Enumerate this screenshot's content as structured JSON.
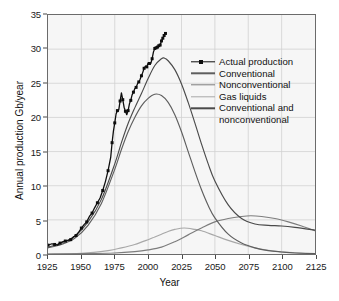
{
  "chart_data": {
    "type": "line",
    "title": "",
    "xlabel": "Year",
    "ylabel": "Annual production Gb/year",
    "xlim": [
      1925,
      2125
    ],
    "ylim": [
      0,
      35
    ],
    "xticks": [
      1925,
      1950,
      1975,
      2000,
      2025,
      2050,
      2075,
      2100,
      2125
    ],
    "yticks": [
      0,
      5,
      10,
      15,
      20,
      25,
      30,
      35
    ],
    "grid": true,
    "legend_position": "upper right",
    "series": [
      {
        "name": "Actual production",
        "color": "#0d0d0d",
        "style": "line-markers",
        "x": [
          1925,
          1928,
          1930,
          1932,
          1934,
          1936,
          1938,
          1940,
          1942,
          1944,
          1946,
          1948,
          1950,
          1952,
          1954,
          1956,
          1958,
          1960,
          1962,
          1964,
          1966,
          1968,
          1970,
          1972,
          1973,
          1974,
          1975,
          1976,
          1977,
          1978,
          1979,
          1980,
          1981,
          1982,
          1983,
          1984,
          1985,
          1986,
          1987,
          1988,
          1989,
          1990,
          1991,
          1992,
          1993,
          1994,
          1995,
          1996,
          1997,
          1998,
          1999,
          2000,
          2001,
          2002,
          2003,
          2004,
          2005,
          2006,
          2007,
          2008,
          2009,
          2010,
          2011,
          2012,
          2013
        ],
        "values": [
          1.3,
          1.5,
          1.4,
          1.3,
          1.6,
          1.8,
          1.9,
          2.0,
          2.1,
          2.5,
          2.7,
          3.2,
          3.8,
          4.3,
          4.7,
          5.5,
          6.0,
          6.8,
          7.5,
          8.2,
          9.3,
          10.6,
          12.2,
          14.2,
          16.3,
          18.0,
          19.2,
          20.5,
          21.0,
          21.1,
          22.4,
          23.6,
          22.6,
          21.5,
          20.9,
          20.4,
          21.0,
          22.0,
          22.5,
          23.3,
          23.7,
          24.2,
          24.4,
          24.9,
          25.2,
          25.6,
          26.1,
          26.6,
          27.2,
          27.5,
          27.4,
          28.0,
          27.9,
          27.9,
          28.6,
          29.6,
          30.1,
          30.2,
          30.3,
          30.5,
          30.6,
          31.2,
          31.6,
          32.0,
          32.3
        ]
      },
      {
        "name": "Conventional",
        "color": "#5e5e5e",
        "style": "line",
        "peak_year": 2005,
        "peak_value": 23.4,
        "x": [
          1925,
          1935,
          1945,
          1955,
          1965,
          1975,
          1980,
          1985,
          1990,
          1995,
          2000,
          2005,
          2010,
          2015,
          2020,
          2025,
          2030,
          2035,
          2040,
          2045,
          2050,
          2060,
          2070,
          2080,
          2090,
          2100,
          2110,
          2125
        ],
        "values": [
          0.9,
          1.4,
          2.3,
          4.2,
          7.4,
          12.4,
          15.3,
          17.9,
          20.0,
          21.7,
          22.8,
          23.4,
          23.2,
          22.2,
          20.4,
          17.9,
          15.0,
          12.1,
          9.4,
          7.1,
          5.3,
          2.9,
          1.6,
          0.9,
          0.5,
          0.3,
          0.15,
          0.05
        ]
      },
      {
        "name": "Nonconventional",
        "color": "#7d7d7d",
        "style": "line",
        "peak_year": 2077,
        "peak_value": 5.6,
        "x": [
          1925,
          1950,
          1975,
          1990,
          2000,
          2010,
          2020,
          2030,
          2040,
          2050,
          2060,
          2070,
          2077,
          2085,
          2095,
          2105,
          2115,
          2125
        ],
        "values": [
          0.0,
          0.05,
          0.15,
          0.35,
          0.6,
          1.0,
          1.8,
          2.8,
          3.8,
          4.7,
          5.2,
          5.5,
          5.6,
          5.5,
          5.2,
          4.7,
          4.1,
          3.4
        ]
      },
      {
        "name": "Gas liquids",
        "color": "#a8a8a8",
        "style": "line",
        "peak_year": 2027,
        "peak_value": 3.8,
        "x": [
          1925,
          1950,
          1970,
          1980,
          1990,
          2000,
          2005,
          2010,
          2015,
          2020,
          2027,
          2035,
          2040,
          2050,
          2060,
          2070,
          2080,
          2090,
          2100,
          2110,
          2125
        ],
        "values": [
          0.0,
          0.1,
          0.5,
          0.9,
          1.4,
          2.1,
          2.5,
          2.9,
          3.3,
          3.6,
          3.8,
          3.6,
          3.4,
          2.7,
          2.0,
          1.4,
          0.9,
          0.55,
          0.3,
          0.18,
          0.06
        ]
      },
      {
        "name": "Conventional and nonconventional",
        "color": "#4a4a4a",
        "style": "line",
        "peak_year": 2012,
        "peak_value": 28.7,
        "x": [
          1925,
          1935,
          1945,
          1955,
          1965,
          1975,
          1980,
          1985,
          1990,
          1995,
          2000,
          2005,
          2010,
          2012,
          2015,
          2020,
          2025,
          2030,
          2035,
          2040,
          2045,
          2050,
          2060,
          2070,
          2080,
          2090,
          2100,
          2110,
          2125
        ],
        "values": [
          1.0,
          1.6,
          2.6,
          4.7,
          8.0,
          13.2,
          16.3,
          19.1,
          21.4,
          23.5,
          25.7,
          27.6,
          28.6,
          28.7,
          28.3,
          27.0,
          24.9,
          22.2,
          19.2,
          16.1,
          13.2,
          10.7,
          7.2,
          5.2,
          4.4,
          4.2,
          4.1,
          3.9,
          3.5
        ]
      }
    ]
  },
  "axis": {
    "y_title": "Annual production Gb/year",
    "x_title": "Year",
    "y_tick_labels": [
      "0",
      "5",
      "10",
      "15",
      "20",
      "25",
      "30",
      "35"
    ],
    "x_tick_labels": [
      "1925",
      "1950",
      "1975",
      "2000",
      "2025",
      "2050",
      "2075",
      "2100",
      "2125"
    ]
  },
  "legend": {
    "items": [
      {
        "label": "Actual production",
        "color": "#0d0d0d",
        "marker": true
      },
      {
        "label": "Conventional",
        "color": "#5e5e5e",
        "marker": false
      },
      {
        "label": "Nonconventional",
        "color": "#7d7d7d",
        "marker": false
      },
      {
        "label": "Gas liquids",
        "color": "#a8a8a8",
        "marker": false
      },
      {
        "label": "Conventional and",
        "color": "#4a4a4a",
        "marker": false
      },
      {
        "label": "nonconventional",
        "color": "#4a4a4a",
        "marker": false,
        "continuation": true
      }
    ]
  }
}
